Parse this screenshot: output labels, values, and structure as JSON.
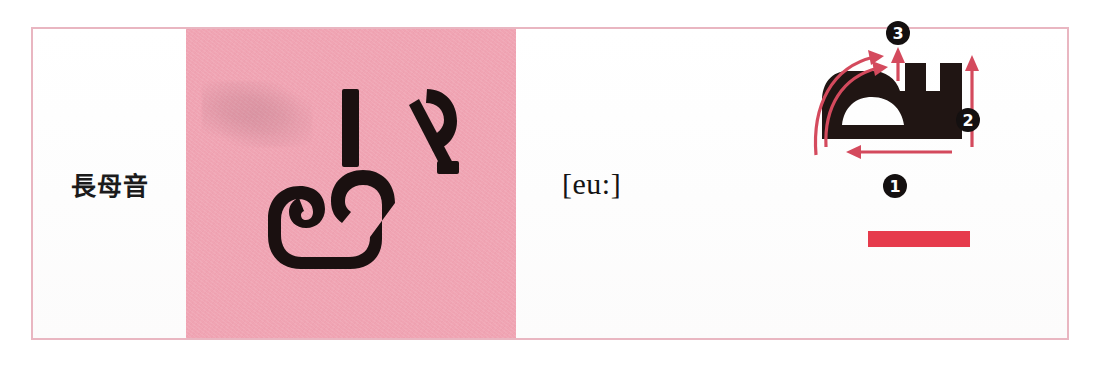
{
  "card": {
    "border_color": "#e9b6c1",
    "background": "#ffffff"
  },
  "label_cell": {
    "category_label": "長母音",
    "meaning": "long vowel"
  },
  "pink_panel": {
    "background_color": "#f0a4b3",
    "glyph_text": "เ-อ",
    "glyph_color": "#1a1010",
    "rotation_degrees": 90,
    "bleed_ghost": "faint-reverse-page-bleed"
  },
  "ipa_cell": {
    "transcription": "[eu:]"
  },
  "stroke_cell": {
    "glyph_color": "#201513",
    "arrow_color": "#d44a5d",
    "underbar_color": "#e63b4c",
    "strokes": [
      {
        "number": "1",
        "marker": "❶",
        "direction": "right-to-left",
        "label_x": 84,
        "label_y": 150
      },
      {
        "number": "2",
        "marker": "❷",
        "direction": "bottom-to-top",
        "label_x": 162,
        "label_y": 84
      },
      {
        "number": "3",
        "marker": "❸",
        "direction": "bottom-to-top",
        "label_x": 84,
        "label_y": 14
      }
    ]
  }
}
